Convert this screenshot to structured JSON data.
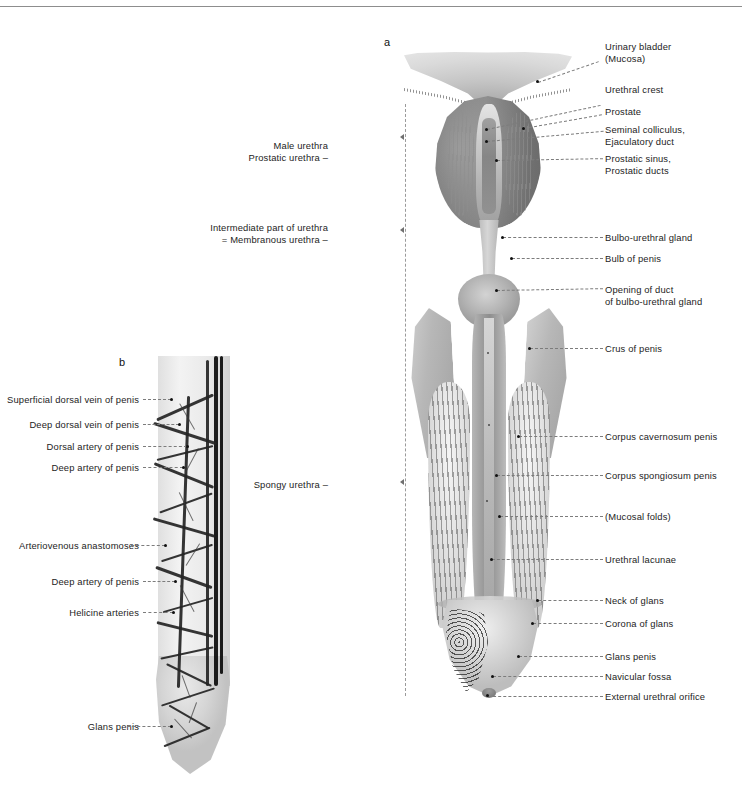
{
  "plate": {
    "figures": [
      {
        "id": "a",
        "letter": "a",
        "caption": "Median section of the male urethra, prostate and penis"
      },
      {
        "id": "b",
        "letter": "b",
        "caption": "Arteries and veins of the penis, vascular preparation"
      }
    ]
  },
  "figure_a": {
    "letter": "a",
    "region_labels": [
      {
        "name": "male-urethra-prostatic-urethra",
        "text": "Male urethra\nProstatic urethra –",
        "y": 137
      },
      {
        "name": "intermediate-part-of-urethra",
        "text": "Intermediate part of urethra\n= Membranous urethra –",
        "y": 219
      },
      {
        "name": "spongy-urethra",
        "text": "Spongy urethra –",
        "y": 475
      }
    ],
    "labels_right": [
      {
        "name": "urinary-bladder-mucosa",
        "text": "Urinary bladder\n(Mucosa)",
        "y": 38
      },
      {
        "name": "urethral-crest",
        "text": "Urethral crest",
        "y": 81
      },
      {
        "name": "prostate",
        "text": "Prostate",
        "y": 103
      },
      {
        "name": "seminal-colliculus-ejaculatory-duct",
        "text": "Seminal colliculus,\nEjaculatory duct",
        "y": 121
      },
      {
        "name": "prostatic-sinus-prostatic-ducts",
        "text": "Prostatic sinus,\nProstatic ducts",
        "y": 150
      },
      {
        "name": "bulbo-urethral-gland",
        "text": "Bulbo-urethral gland",
        "y": 229
      },
      {
        "name": "bulb-of-penis",
        "text": "Bulb of penis",
        "y": 250
      },
      {
        "name": "opening-of-duct-of-bulbo-urethral-gland",
        "text": "Opening of duct\nof bulbo-urethral gland",
        "y": 281
      },
      {
        "name": "crus-of-penis",
        "text": "Crus of penis",
        "y": 340
      },
      {
        "name": "corpus-cavernosum-penis",
        "text": "Corpus cavernosum penis",
        "y": 428
      },
      {
        "name": "corpus-spongiosum-penis",
        "text": "Corpus spongiosum penis",
        "y": 467
      },
      {
        "name": "mucosal-folds",
        "text": "(Mucosal folds)",
        "y": 508
      },
      {
        "name": "urethral-lacunae",
        "text": "Urethral lacunae",
        "y": 551
      },
      {
        "name": "neck-of-glans",
        "text": "Neck of glans",
        "y": 592
      },
      {
        "name": "corona-of-glans",
        "text": "Corona of glans",
        "y": 615
      },
      {
        "name": "glans-penis",
        "text": "Glans penis",
        "y": 648
      },
      {
        "name": "navicular-fossa",
        "text": "Navicular fossa",
        "y": 668
      },
      {
        "name": "external-urethral-orifice",
        "text": "External urethral orifice",
        "y": 688
      }
    ]
  },
  "figure_b": {
    "letter": "b",
    "labels_left": [
      {
        "name": "superficial-dorsal-vein-of-penis",
        "text": "Superficial dorsal vein of penis",
        "y": 391
      },
      {
        "name": "deep-dorsal-vein-of-penis",
        "text": "Deep dorsal vein of penis",
        "y": 416
      },
      {
        "name": "dorsal-artery-of-penis",
        "text": "Dorsal artery of penis",
        "y": 438
      },
      {
        "name": "deep-artery-of-penis-upper",
        "text": "Deep artery of penis",
        "y": 459
      },
      {
        "name": "arteriovenous-anastomoses",
        "text": "Arteriovenous anastomoses",
        "y": 537
      },
      {
        "name": "deep-artery-of-penis-lower",
        "text": "Deep artery of penis",
        "y": 573
      },
      {
        "name": "helicine-arteries",
        "text": "Helicine arteries",
        "y": 604
      },
      {
        "name": "glans-penis",
        "text": "Glans penis",
        "y": 718
      }
    ]
  },
  "style": {
    "page_background": "#ffffff",
    "text_color": "#1d1d1d",
    "leader_color": "#7c7c7c",
    "rule_color": "#8d8d8d"
  }
}
